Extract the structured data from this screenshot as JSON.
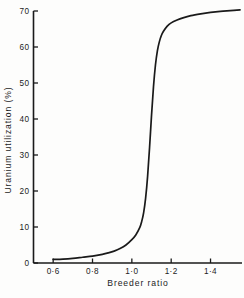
{
  "chart_data": {
    "type": "line",
    "title": "",
    "xlabel": "Breeder ratio",
    "ylabel": "Uranium utilization (%)",
    "xlim": [
      0.5,
      1.56
    ],
    "ylim": [
      0,
      70
    ],
    "grid": false,
    "legend": null,
    "x_ticks": [
      {
        "value": 0.6,
        "label": "0·6"
      },
      {
        "value": 0.8,
        "label": "0·8"
      },
      {
        "value": 1.0,
        "label": "1·0"
      },
      {
        "value": 1.2,
        "label": "1·2"
      },
      {
        "value": 1.4,
        "label": "1·4"
      }
    ],
    "y_ticks": [
      {
        "value": 0,
        "label": "0"
      },
      {
        "value": 10,
        "label": "10"
      },
      {
        "value": 20,
        "label": "20"
      },
      {
        "value": 30,
        "label": "30"
      },
      {
        "value": 40,
        "label": "40"
      },
      {
        "value": 50,
        "label": "50"
      },
      {
        "value": 60,
        "label": "60"
      },
      {
        "value": 70,
        "label": "70"
      }
    ],
    "series": [
      {
        "name": "Uranium utilization",
        "color": "#1a1a1a",
        "x": [
          0.6,
          0.65,
          0.7,
          0.75,
          0.8,
          0.85,
          0.88,
          0.91,
          0.94,
          0.97,
          1.0,
          1.02,
          1.04,
          1.05,
          1.06,
          1.07,
          1.08,
          1.09,
          1.1,
          1.11,
          1.12,
          1.13,
          1.14,
          1.15,
          1.16,
          1.18,
          1.2,
          1.23,
          1.26,
          1.3,
          1.35,
          1.4,
          1.45,
          1.5,
          1.55
        ],
        "y": [
          1.0,
          1.1,
          1.3,
          1.6,
          1.9,
          2.4,
          2.8,
          3.3,
          4.0,
          5.0,
          6.5,
          7.8,
          9.8,
          11.5,
          14.0,
          18.0,
          24.0,
          32.0,
          41.0,
          49.0,
          55.0,
          59.0,
          61.5,
          63.2,
          64.3,
          65.8,
          66.7,
          67.5,
          68.1,
          68.7,
          69.2,
          69.6,
          69.9,
          70.1,
          70.3
        ]
      }
    ]
  },
  "axis_style": {
    "line_color": "#1a1a1a",
    "curve_color": "#1a1a1a"
  }
}
